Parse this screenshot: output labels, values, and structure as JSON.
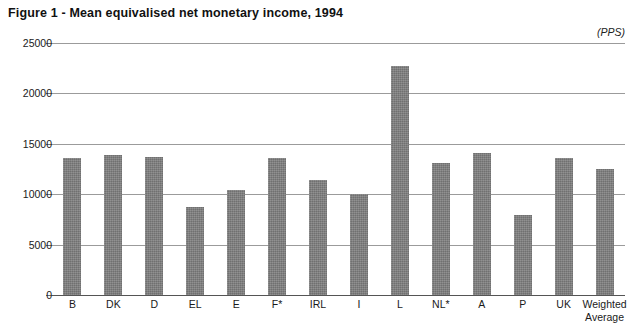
{
  "figure": {
    "title": "Figure 1 - Mean equivalised net monetary income, 1994",
    "units_label": "(PPS)"
  },
  "chart_data": {
    "type": "bar",
    "title": "Figure 1 - Mean equivalised net monetary income, 1994",
    "subtitle": "",
    "xlabel": "",
    "ylabel": "",
    "units": "(PPS)",
    "ylim": [
      0,
      25000
    ],
    "ytick_labels": [
      "25000",
      "20000",
      "15000",
      "10000",
      "5000",
      "0"
    ],
    "yticks": [
      25000,
      20000,
      15000,
      10000,
      5000,
      0
    ],
    "grid": true,
    "legend": false,
    "legend_position": "none",
    "bar_color": "#7d7d7d",
    "categories": [
      "B",
      "DK",
      "D",
      "EL",
      "E",
      "F*",
      "IRL",
      "I",
      "L",
      "NL*",
      "A",
      "P",
      "UK",
      "Weighted Average"
    ],
    "category_lines": [
      [
        "B"
      ],
      [
        "DK"
      ],
      [
        "D"
      ],
      [
        "EL"
      ],
      [
        "E"
      ],
      [
        "F*"
      ],
      [
        "IRL"
      ],
      [
        "I"
      ],
      [
        "L"
      ],
      [
        "NL*"
      ],
      [
        "A"
      ],
      [
        "P"
      ],
      [
        "UK"
      ],
      [
        "Weighted",
        "Average"
      ]
    ],
    "values": [
      13600,
      13900,
      13700,
      8700,
      10400,
      13600,
      11400,
      10000,
      22700,
      13100,
      14100,
      7900,
      13600,
      12500
    ]
  }
}
